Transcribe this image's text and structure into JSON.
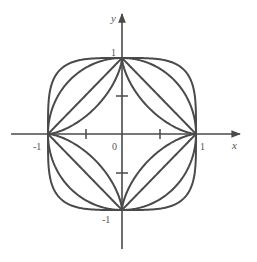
{
  "figure": {
    "axes": {
      "x_label": "x",
      "y_label": "y",
      "origin_label": "0",
      "x_ticks": [
        "-1",
        "1"
      ],
      "y_ticks": [
        "1",
        "-1"
      ]
    },
    "curves": [
      {
        "name": "astroid",
        "exponent": 0.6667
      },
      {
        "name": "square",
        "exponent": 1
      },
      {
        "name": "circle",
        "exponent": 2
      },
      {
        "name": "superellipse",
        "exponent": 4
      }
    ],
    "colors": {
      "stroke": "#4a4a4a",
      "background": "#ffffff"
    }
  }
}
